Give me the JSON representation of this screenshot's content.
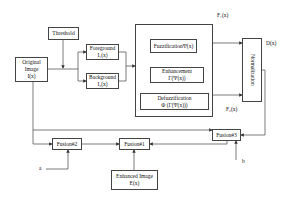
{
  "diagram": {
    "nodes": {
      "threshold": {
        "line1": "Threshold"
      },
      "original": {
        "line1": "Original",
        "line2": "Image",
        "line3": "I(x)"
      },
      "foreground": {
        "line1": "Foreground",
        "line2": "I₁(x)"
      },
      "background": {
        "line1": "Background",
        "line2": "I₂(x)"
      },
      "fuzzification": {
        "line1": "FuzzificationΨ(x)"
      },
      "enhancement": {
        "line1": "Enhancement",
        "line2": "Γ(Ψ(x))"
      },
      "defuzzification": {
        "line1": "Defuzzification",
        "line2": "Φ (Γ(Ψ(x)))"
      },
      "normalization": {
        "line1": "Normalization"
      },
      "fusion3": {
        "line1": "Fusion#3"
      },
      "fusion2": {
        "line1": "Fusion#2"
      },
      "fusion1": {
        "line1": "Fusion#1"
      },
      "enhanced": {
        "line1": "Enhanced Image",
        "line2": "E(x)"
      }
    },
    "labels": {
      "f1": "F₁(x)",
      "f2": "F₂(x)",
      "d": "D(x)",
      "a": "a",
      "b": "b"
    },
    "colors": {
      "stroke": "#444444",
      "background": "#ffffff"
    }
  }
}
